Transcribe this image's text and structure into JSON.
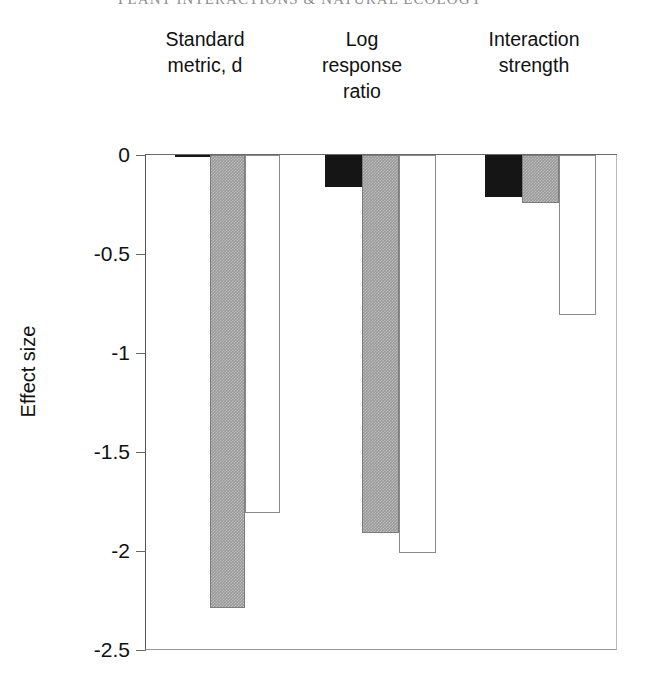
{
  "running_header": "PLANT INTERACTIONS & NATURAL ECOLOGY",
  "axis": {
    "y_title": "Effect size",
    "y_ticks": [
      "0",
      "-0.5",
      "-1",
      "-1.5",
      "-2",
      "-2.5"
    ]
  },
  "group_headers": [
    "Standard\nmetric, d",
    "Log\nresponse\nratio",
    "Interaction\nstrength"
  ],
  "chart_data": {
    "type": "bar",
    "title": "",
    "xlabel": "",
    "ylabel": "Effect size",
    "ylim": [
      -2.5,
      0
    ],
    "yticks": [
      0,
      -0.5,
      -1,
      -1.5,
      -2,
      -2.5
    ],
    "grid": false,
    "legend": "none",
    "categories": [
      "Standard metric, d",
      "Log response ratio",
      "Interaction strength"
    ],
    "series": [
      {
        "name": "black",
        "color": "#151515",
        "values": [
          -0.01,
          -0.16,
          -0.21
        ]
      },
      {
        "name": "gray",
        "color": "#9a9a9a",
        "values": [
          -2.29,
          -1.91,
          -0.24
        ]
      },
      {
        "name": "white",
        "color": "#ffffff",
        "values": [
          -1.81,
          -2.01,
          -0.81
        ]
      }
    ]
  }
}
